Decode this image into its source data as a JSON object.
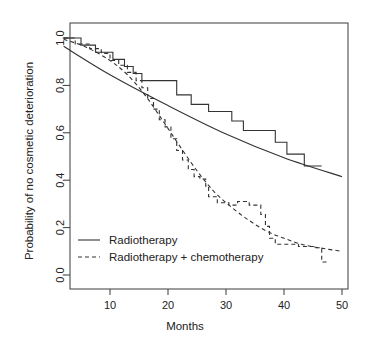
{
  "chart_data": {
    "type": "line",
    "title": "",
    "xlabel": "Months",
    "ylabel": "Probability of no cosmetic deterioration",
    "xlim": [
      0,
      50
    ],
    "ylim": [
      0.0,
      1.0
    ],
    "xticks": [
      10,
      20,
      30,
      40,
      50
    ],
    "xticklabels": [
      "10",
      "20",
      "30",
      "40",
      "50"
    ],
    "yticks": [
      0.0,
      0.2,
      0.4,
      0.6,
      0.8,
      1.0
    ],
    "yticklabels": [
      "0.0",
      "0.2",
      "0.4",
      "0.6",
      "0.8",
      "1.0"
    ],
    "grid": false,
    "legend_position": "bottom-left",
    "box": true,
    "series": [
      {
        "name": "Radiotherapy",
        "style": "step-solid",
        "color": "#333333",
        "points": [
          [
            2.0,
            1.0
          ],
          [
            5.0,
            1.0
          ],
          [
            5.0,
            0.97
          ],
          [
            7.5,
            0.97
          ],
          [
            7.5,
            0.94
          ],
          [
            10.5,
            0.94
          ],
          [
            10.5,
            0.91
          ],
          [
            12.5,
            0.91
          ],
          [
            12.5,
            0.88
          ],
          [
            14.0,
            0.88
          ],
          [
            14.0,
            0.85
          ],
          [
            15.5,
            0.85
          ],
          [
            15.5,
            0.82
          ],
          [
            21.5,
            0.82
          ],
          [
            21.5,
            0.76
          ],
          [
            24.0,
            0.76
          ],
          [
            24.0,
            0.72
          ],
          [
            27.0,
            0.72
          ],
          [
            27.0,
            0.69
          ],
          [
            31.0,
            0.69
          ],
          [
            31.0,
            0.65
          ],
          [
            33.0,
            0.65
          ],
          [
            33.0,
            0.61
          ],
          [
            38.5,
            0.61
          ],
          [
            38.5,
            0.56
          ],
          [
            40.5,
            0.56
          ],
          [
            40.5,
            0.51
          ],
          [
            43.5,
            0.51
          ],
          [
            43.5,
            0.46
          ],
          [
            46.5,
            0.46
          ]
        ]
      },
      {
        "name": "Radiotherapy fitted",
        "style": "smooth-solid",
        "color": "#333333",
        "points": [
          [
            2.0,
            0.965
          ],
          [
            10.0,
            0.845
          ],
          [
            20.0,
            0.715
          ],
          [
            30.0,
            0.595
          ],
          [
            40.0,
            0.495
          ],
          [
            50.0,
            0.415
          ]
        ]
      },
      {
        "name": "Radiotherapy + chemotherapy",
        "style": "step-dashed",
        "color": "#333333",
        "points": [
          [
            2.0,
            1.0
          ],
          [
            4.0,
            1.0
          ],
          [
            4.0,
            0.975
          ],
          [
            6.5,
            0.975
          ],
          [
            6.5,
            0.955
          ],
          [
            8.5,
            0.955
          ],
          [
            8.5,
            0.935
          ],
          [
            10.0,
            0.935
          ],
          [
            10.0,
            0.905
          ],
          [
            11.5,
            0.905
          ],
          [
            11.5,
            0.885
          ],
          [
            13.0,
            0.885
          ],
          [
            13.0,
            0.855
          ],
          [
            14.5,
            0.855
          ],
          [
            14.5,
            0.82
          ],
          [
            15.5,
            0.82
          ],
          [
            15.5,
            0.79
          ],
          [
            16.5,
            0.79
          ],
          [
            16.5,
            0.745
          ],
          [
            17.5,
            0.745
          ],
          [
            17.5,
            0.7
          ],
          [
            18.5,
            0.7
          ],
          [
            18.5,
            0.655
          ],
          [
            19.5,
            0.655
          ],
          [
            19.5,
            0.625
          ],
          [
            20.5,
            0.625
          ],
          [
            20.5,
            0.575
          ],
          [
            21.5,
            0.575
          ],
          [
            21.5,
            0.525
          ],
          [
            22.5,
            0.525
          ],
          [
            22.5,
            0.485
          ],
          [
            23.5,
            0.485
          ],
          [
            23.5,
            0.445
          ],
          [
            24.5,
            0.445
          ],
          [
            24.5,
            0.415
          ],
          [
            25.5,
            0.415
          ],
          [
            25.5,
            0.405
          ],
          [
            26.5,
            0.405
          ],
          [
            26.5,
            0.375
          ],
          [
            27.0,
            0.375
          ],
          [
            27.0,
            0.33
          ],
          [
            28.5,
            0.33
          ],
          [
            28.5,
            0.305
          ],
          [
            30.5,
            0.305
          ],
          [
            30.5,
            0.295
          ],
          [
            32.0,
            0.295
          ],
          [
            32.0,
            0.31
          ],
          [
            34.0,
            0.31
          ],
          [
            34.0,
            0.295
          ],
          [
            36.0,
            0.295
          ],
          [
            36.0,
            0.255
          ],
          [
            36.8,
            0.255
          ],
          [
            36.8,
            0.205
          ],
          [
            37.5,
            0.205
          ],
          [
            37.5,
            0.155
          ],
          [
            38.5,
            0.155
          ],
          [
            38.5,
            0.13
          ],
          [
            42.5,
            0.13
          ],
          [
            42.5,
            0.12
          ],
          [
            45.5,
            0.12
          ],
          [
            45.5,
            0.115
          ],
          [
            46.5,
            0.115
          ],
          [
            46.5,
            0.055
          ],
          [
            47.5,
            0.055
          ]
        ]
      },
      {
        "name": "Radiotherapy + chemotherapy fitted",
        "style": "smooth-dashed",
        "color": "#333333",
        "points": [
          [
            2.0,
            0.995
          ],
          [
            6.0,
            0.96
          ],
          [
            10.0,
            0.905
          ],
          [
            13.0,
            0.845
          ],
          [
            16.0,
            0.76
          ],
          [
            19.0,
            0.655
          ],
          [
            22.0,
            0.545
          ],
          [
            25.0,
            0.44
          ],
          [
            28.0,
            0.35
          ],
          [
            31.0,
            0.285
          ],
          [
            34.0,
            0.23
          ],
          [
            37.0,
            0.185
          ],
          [
            40.0,
            0.155
          ],
          [
            43.0,
            0.13
          ],
          [
            46.0,
            0.115
          ],
          [
            50.0,
            0.1
          ]
        ]
      }
    ],
    "legend": [
      {
        "label": "Radiotherapy",
        "style": "solid"
      },
      {
        "label": "Radiotherapy + chemotherapy",
        "style": "dashed"
      }
    ]
  }
}
